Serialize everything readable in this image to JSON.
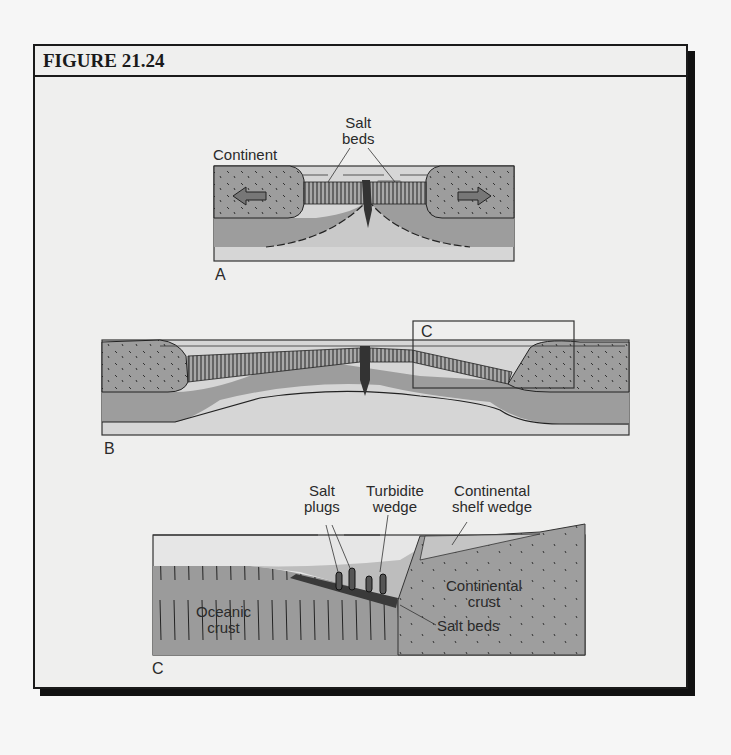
{
  "figure": {
    "title": "FIGURE 21.24"
  },
  "panel_a": {
    "letter": "A",
    "labels": {
      "continent": "Continent",
      "salt_beds_line1": "Salt",
      "salt_beds_line2": "beds"
    }
  },
  "panel_b": {
    "letter": "B",
    "inset_letter": "C"
  },
  "panel_c": {
    "letter": "C",
    "labels": {
      "salt_plugs_line1": "Salt",
      "salt_plugs_line2": "plugs",
      "turbidite_line1": "Turbidite",
      "turbidite_line2": "wedge",
      "shelf_line1": "Continental",
      "shelf_line2": "shelf wedge",
      "cont_crust_line1": "Continental",
      "cont_crust_line2": "crust",
      "oceanic_line1": "Oceanic",
      "oceanic_line2": "crust",
      "salt_beds": "Salt beds"
    }
  },
  "colors": {
    "crust_gray": "#9b9b9b",
    "mantle_light": "#c8c8c8",
    "base_light": "#d9d9d9",
    "ink": "#1a1a1a"
  }
}
